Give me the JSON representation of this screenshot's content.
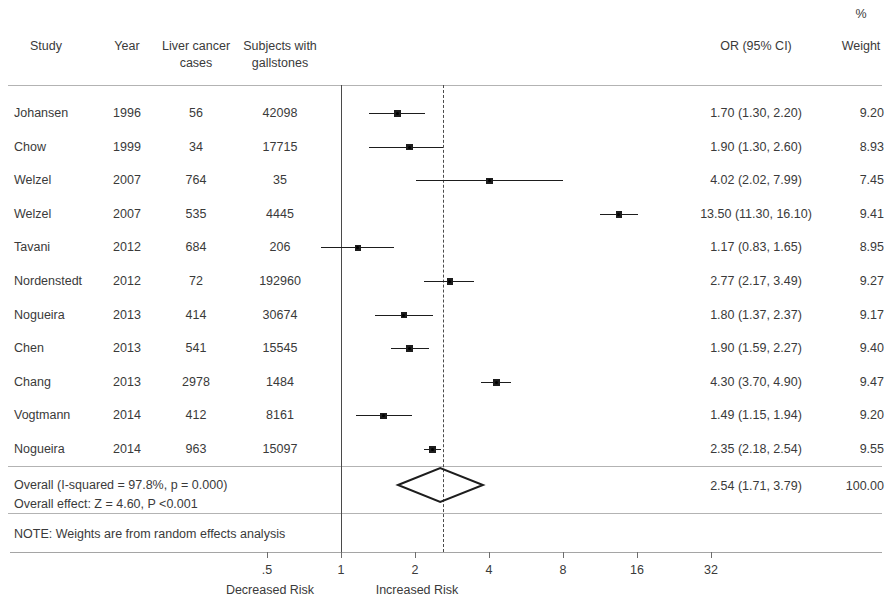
{
  "header": {
    "study": "Study",
    "year": "Year",
    "cases_line1": "Liver cancer",
    "cases_line2": "cases",
    "subjects_line1": "Subjects with",
    "subjects_line2": "gallstones",
    "or_ci": "OR (95% CI)",
    "weight_pct": "%",
    "weight": "Weight"
  },
  "axis": {
    "ticks": [
      {
        "label": ".5",
        "value": 0.5
      },
      {
        "label": "1",
        "value": 1
      },
      {
        "label": "2",
        "value": 2
      },
      {
        "label": "4",
        "value": 4
      },
      {
        "label": "8",
        "value": 8
      },
      {
        "label": "16",
        "value": 16
      },
      {
        "label": "32",
        "value": 32
      }
    ],
    "left_label": "Decreased Risk",
    "right_label": "Increased Risk",
    "null_value": 1
  },
  "overall": {
    "heterogeneity": "Overall  (I-squared = 97.8%, p = 0.000)",
    "effect": "Overall effect: Z = 4.60, P <0.001",
    "note": "NOTE: Weights are from random effects analysis",
    "or_ci_label": "2.54 (1.71, 3.79)",
    "weight_label": "100.00"
  },
  "chart_data": {
    "type": "forest",
    "title": "",
    "xlabel": "",
    "ylabel": "",
    "xscale": "log",
    "xlim": [
      0.4,
      40
    ],
    "null_line": 1,
    "pooled_line": 2.54,
    "grid": false,
    "columns": [
      "Study",
      "Year",
      "Liver cancer cases",
      "Subjects with gallstones",
      "OR (95% CI)",
      "% Weight"
    ],
    "rows": [
      {
        "study": "Johansen",
        "year": "1996",
        "cases": "56",
        "subjects": "42098",
        "or": 1.7,
        "lo": 1.3,
        "hi": 2.2,
        "or_ci_label": "1.70 (1.30, 2.20)",
        "weight": 9.2,
        "weight_label": "9.20"
      },
      {
        "study": "Chow",
        "year": "1999",
        "cases": "34",
        "subjects": "17715",
        "or": 1.9,
        "lo": 1.3,
        "hi": 2.6,
        "or_ci_label": "1.90 (1.30, 2.60)",
        "weight": 8.93,
        "weight_label": "8.93"
      },
      {
        "study": "Welzel",
        "year": "2007",
        "cases": "764",
        "subjects": "35",
        "or": 4.02,
        "lo": 2.02,
        "hi": 7.99,
        "or_ci_label": "4.02 (2.02, 7.99)",
        "weight": 7.45,
        "weight_label": "7.45"
      },
      {
        "study": "Welzel",
        "year": "2007",
        "cases": "535",
        "subjects": "4445",
        "or": 13.5,
        "lo": 11.3,
        "hi": 16.1,
        "or_ci_label": "13.50 (11.30, 16.10)",
        "weight": 9.41,
        "weight_label": "9.41"
      },
      {
        "study": "Tavani",
        "year": "2012",
        "cases": "684",
        "subjects": "206",
        "or": 1.17,
        "lo": 0.83,
        "hi": 1.65,
        "or_ci_label": "1.17 (0.83, 1.65)",
        "weight": 8.95,
        "weight_label": "8.95"
      },
      {
        "study": "Nordenstedt",
        "year": "2012",
        "cases": "72",
        "subjects": "192960",
        "or": 2.77,
        "lo": 2.17,
        "hi": 3.49,
        "or_ci_label": "2.77 (2.17, 3.49)",
        "weight": 9.27,
        "weight_label": "9.27"
      },
      {
        "study": "Nogueira",
        "year": "2013",
        "cases": "414",
        "subjects": "30674",
        "or": 1.8,
        "lo": 1.37,
        "hi": 2.37,
        "or_ci_label": "1.80 (1.37, 2.37)",
        "weight": 9.17,
        "weight_label": "9.17"
      },
      {
        "study": "Chen",
        "year": "2013",
        "cases": "541",
        "subjects": "15545",
        "or": 1.9,
        "lo": 1.59,
        "hi": 2.27,
        "or_ci_label": "1.90 (1.59, 2.27)",
        "weight": 9.4,
        "weight_label": "9.40"
      },
      {
        "study": "Chang",
        "year": "2013",
        "cases": "2978",
        "subjects": "1484",
        "or": 4.3,
        "lo": 3.7,
        "hi": 4.9,
        "or_ci_label": "4.30 (3.70, 4.90)",
        "weight": 9.47,
        "weight_label": "9.47"
      },
      {
        "study": "Vogtmann",
        "year": "2014",
        "cases": "412",
        "subjects": "8161",
        "or": 1.49,
        "lo": 1.15,
        "hi": 1.94,
        "or_ci_label": "1.49 (1.15, 1.94)",
        "weight": 9.2,
        "weight_label": "9.20"
      },
      {
        "study": "Nogueira",
        "year": "2014",
        "cases": "963",
        "subjects": "15097",
        "or": 2.35,
        "lo": 2.18,
        "hi": 2.54,
        "or_ci_label": "2.35 (2.18, 2.54)",
        "weight": 9.55,
        "weight_label": "9.55"
      }
    ],
    "pooled": {
      "or": 2.54,
      "lo": 1.71,
      "hi": 3.79,
      "or_ci_label": "2.54 (1.71, 3.79)",
      "weight_label": "100.00"
    }
  }
}
